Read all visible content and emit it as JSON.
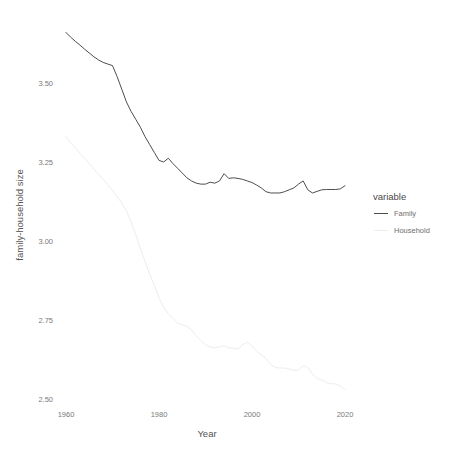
{
  "chart_data": {
    "type": "line",
    "title": "",
    "xlabel": "Year",
    "ylabel": "family-household size",
    "xlim": [
      1959,
      2021
    ],
    "ylim": [
      2.47,
      3.68
    ],
    "xticks": [
      1960,
      1980,
      2000,
      2020
    ],
    "xtick_labels": [
      "1960",
      "1980",
      "2000",
      "2020"
    ],
    "yticks": [
      2.5,
      2.75,
      3.0,
      3.25,
      3.5
    ],
    "ytick_labels": [
      "2.50",
      "2.75",
      "3.00",
      "3.25",
      "3.50"
    ],
    "grid": false,
    "legend": {
      "title": "variable",
      "position": "right",
      "entries": [
        {
          "name": "Family",
          "color": "#4d4d4d"
        },
        {
          "name": "Household",
          "color": "#ededed"
        }
      ]
    },
    "x": [
      1960,
      1961,
      1962,
      1963,
      1964,
      1965,
      1966,
      1967,
      1968,
      1969,
      1970,
      1971,
      1972,
      1973,
      1974,
      1975,
      1976,
      1977,
      1978,
      1979,
      1980,
      1981,
      1982,
      1983,
      1984,
      1985,
      1986,
      1987,
      1988,
      1989,
      1990,
      1991,
      1992,
      1993,
      1994,
      1995,
      1996,
      1997,
      1998,
      1999,
      2000,
      2001,
      2002,
      2003,
      2004,
      2005,
      2006,
      2007,
      2008,
      2009,
      2010,
      2011,
      2012,
      2013,
      2014,
      2015,
      2016,
      2017,
      2018,
      2019,
      2020
    ],
    "series": [
      {
        "name": "Family",
        "color": "#4d4d4d",
        "values": [
          3.66,
          3.645,
          3.632,
          3.62,
          3.607,
          3.595,
          3.583,
          3.573,
          3.565,
          3.56,
          3.555,
          3.52,
          3.48,
          3.44,
          3.41,
          3.385,
          3.36,
          3.33,
          3.305,
          3.28,
          3.255,
          3.25,
          3.262,
          3.245,
          3.23,
          3.215,
          3.2,
          3.19,
          3.183,
          3.18,
          3.18,
          3.186,
          3.183,
          3.19,
          3.213,
          3.198,
          3.2,
          3.198,
          3.195,
          3.19,
          3.185,
          3.177,
          3.168,
          3.156,
          3.152,
          3.152,
          3.152,
          3.156,
          3.162,
          3.168,
          3.18,
          3.19,
          3.162,
          3.152,
          3.157,
          3.162,
          3.163,
          3.163,
          3.163,
          3.165,
          3.175
        ]
      },
      {
        "name": "Household",
        "color": "#ededed",
        "values": [
          3.33,
          3.31,
          3.295,
          3.278,
          3.262,
          3.245,
          3.228,
          3.212,
          3.195,
          3.178,
          3.16,
          3.14,
          3.12,
          3.095,
          3.06,
          3.02,
          2.975,
          2.935,
          2.895,
          2.86,
          2.82,
          2.79,
          2.77,
          2.755,
          2.74,
          2.735,
          2.73,
          2.718,
          2.7,
          2.685,
          2.672,
          2.665,
          2.662,
          2.665,
          2.668,
          2.662,
          2.66,
          2.658,
          2.672,
          2.68,
          2.668,
          2.652,
          2.64,
          2.628,
          2.61,
          2.6,
          2.598,
          2.598,
          2.595,
          2.59,
          2.592,
          2.605,
          2.6,
          2.58,
          2.565,
          2.56,
          2.552,
          2.548,
          2.548,
          2.54,
          2.53
        ]
      }
    ]
  },
  "panel": {
    "axis_title_y": "family-household size",
    "axis_title_x": "Year"
  }
}
